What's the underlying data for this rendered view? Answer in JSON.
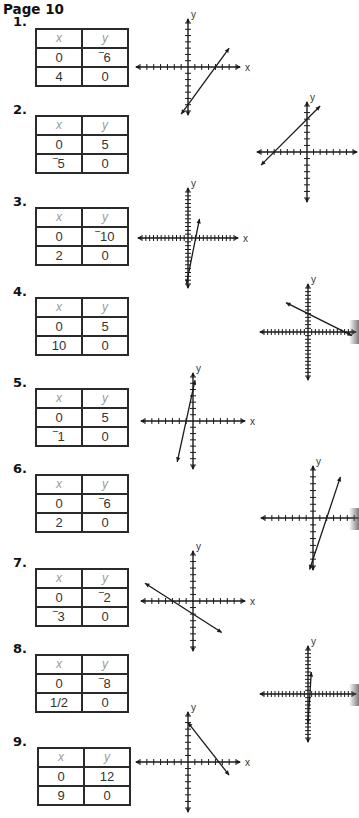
{
  "page": {
    "title": "Page 10"
  },
  "problems": [
    {
      "number": "1.",
      "header": {
        "x": "x",
        "y": "y"
      },
      "rows": [
        [
          "0",
          "‾6"
        ],
        [
          "4",
          "0"
        ]
      ]
    },
    {
      "number": "2.",
      "header": {
        "x": "x",
        "y": "y"
      },
      "rows": [
        [
          "0",
          "5"
        ],
        [
          "‾5",
          "0"
        ]
      ]
    },
    {
      "number": "3.",
      "header": {
        "x": "x",
        "y": "y"
      },
      "rows": [
        [
          "0",
          "‾10"
        ],
        [
          "2",
          "0"
        ]
      ]
    },
    {
      "number": "4.",
      "header": {
        "x": "x",
        "y": "y"
      },
      "rows": [
        [
          "0",
          "5"
        ],
        [
          "10",
          "0"
        ]
      ]
    },
    {
      "number": "5.",
      "header": {
        "x": "x",
        "y": "y"
      },
      "rows": [
        [
          "0",
          "5"
        ],
        [
          "‾1",
          "0"
        ]
      ]
    },
    {
      "number": "6.",
      "header": {
        "x": "x",
        "y": "y"
      },
      "rows": [
        [
          "0",
          "‾6"
        ],
        [
          "2",
          "0"
        ]
      ]
    },
    {
      "number": "7.",
      "header": {
        "x": "x",
        "y": "y"
      },
      "rows": [
        [
          "0",
          "‾2"
        ],
        [
          "‾3",
          "0"
        ]
      ]
    },
    {
      "number": "8.",
      "header": {
        "x": "x",
        "y": "y"
      },
      "rows": [
        [
          "0",
          "‾8"
        ],
        [
          "1/2",
          "0"
        ]
      ]
    },
    {
      "number": "9.",
      "header": {
        "x": "x",
        "y": "y"
      },
      "rows": [
        [
          "0",
          "12"
        ],
        [
          "9",
          "0"
        ]
      ]
    }
  ],
  "axis_labels": {
    "x": "x",
    "y": "y"
  },
  "chart_data": [
    {
      "type": "line",
      "title": "1",
      "points": [
        [
          0,
          -6
        ],
        [
          4,
          0
        ]
      ],
      "line_from": [
        -1,
        -7.5
      ],
      "line_to": [
        6,
        3
      ],
      "slope": 1.5,
      "y_intercept": -6,
      "x_intercept": 4,
      "xlabel": "x",
      "ylabel": "y",
      "tick_step": 1,
      "xlim": [
        -6,
        6
      ],
      "ylim": [
        -6,
        6
      ],
      "grid": false
    },
    {
      "type": "line",
      "title": "2",
      "points": [
        [
          0,
          5
        ],
        [
          -5,
          0
        ]
      ],
      "line_from": [
        -7,
        -2
      ],
      "line_to": [
        2,
        7
      ],
      "slope": 1,
      "y_intercept": 5,
      "x_intercept": -5,
      "xlabel": "x",
      "ylabel": "y",
      "tick_step": 1,
      "xlim": [
        -7,
        7
      ],
      "ylim": [
        -7,
        7
      ],
      "grid": false
    },
    {
      "type": "line",
      "title": "3",
      "points": [
        [
          0,
          -10
        ],
        [
          2,
          0
        ]
      ],
      "line_from": [
        -0.4,
        -12
      ],
      "line_to": [
        3,
        5
      ],
      "slope": 5,
      "y_intercept": -10,
      "x_intercept": 2,
      "xlabel": "x",
      "ylabel": "y",
      "tick_step": 1,
      "xlim": [
        -12,
        12
      ],
      "ylim": [
        -12,
        12
      ],
      "grid": false
    },
    {
      "type": "line",
      "title": "4",
      "points": [
        [
          0,
          5
        ],
        [
          10,
          0
        ]
      ],
      "line_from": [
        -6,
        8
      ],
      "line_to": [
        12,
        -1
      ],
      "slope": -0.5,
      "y_intercept": 5,
      "x_intercept": 10,
      "xlabel": "x",
      "ylabel": "y",
      "tick_step": 1,
      "xlim": [
        -12,
        12
      ],
      "ylim": [
        -12,
        12
      ],
      "grid": false
    },
    {
      "type": "line",
      "title": "5",
      "points": [
        [
          0,
          5
        ],
        [
          -1,
          0
        ]
      ],
      "line_from": [
        -2.3,
        -6.5
      ],
      "line_to": [
        0.3,
        6.5
      ],
      "slope": 5,
      "y_intercept": 5,
      "x_intercept": -1,
      "xlabel": "x",
      "ylabel": "y",
      "tick_step": 1,
      "xlim": [
        -7,
        7
      ],
      "ylim": [
        -7,
        7
      ],
      "grid": false
    },
    {
      "type": "line",
      "title": "6",
      "points": [
        [
          0,
          -6
        ],
        [
          2,
          0
        ]
      ],
      "line_from": [
        -0.5,
        -7.5
      ],
      "line_to": [
        4,
        6
      ],
      "slope": 3,
      "y_intercept": -6,
      "x_intercept": 2,
      "xlabel": "x",
      "ylabel": "y",
      "tick_step": 1,
      "xlim": [
        -7,
        7
      ],
      "ylim": [
        -7,
        7
      ],
      "grid": false
    },
    {
      "type": "line",
      "title": "7",
      "points": [
        [
          0,
          -2
        ],
        [
          -3,
          0
        ]
      ],
      "line_from": [
        -7,
        2.7
      ],
      "line_to": [
        4.2,
        -4.8
      ],
      "slope": -0.667,
      "y_intercept": -2,
      "x_intercept": -3,
      "xlabel": "x",
      "ylabel": "y",
      "tick_step": 1,
      "xlim": [
        -7,
        7
      ],
      "ylim": [
        -7,
        7
      ],
      "grid": false
    },
    {
      "type": "line",
      "title": "8",
      "points": [
        [
          0,
          -8
        ],
        [
          0.5,
          0
        ]
      ],
      "line_from": [
        0,
        -8
      ],
      "line_to": [
        0.9,
        6
      ],
      "slope": 16,
      "y_intercept": -8,
      "x_intercept": 0.5,
      "xlabel": "x",
      "ylabel": "y",
      "tick_step": 1,
      "xlim": [
        -12,
        12
      ],
      "ylim": [
        -12,
        12
      ],
      "grid": false
    },
    {
      "type": "line",
      "title": "9",
      "points": [
        [
          0,
          12
        ],
        [
          9,
          0
        ]
      ],
      "line_from": [
        0,
        12
      ],
      "line_to": [
        12,
        -4
      ],
      "slope": -1.333,
      "y_intercept": 12,
      "x_intercept": 9,
      "xlabel": "x",
      "ylabel": "y",
      "tick_step": 2,
      "xlim": [
        -12,
        12
      ],
      "ylim": [
        -12,
        12
      ],
      "grid": false
    }
  ]
}
